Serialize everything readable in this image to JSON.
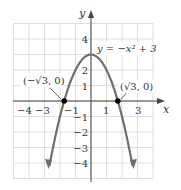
{
  "chart_data": {
    "type": "line",
    "title": "",
    "function_label": "y = −x² + 3",
    "xlabel": "x",
    "ylabel": "y",
    "xlim": [
      -5,
      4
    ],
    "ylim": [
      -5,
      5
    ],
    "grid": true,
    "x_tick_labels": [
      "−4",
      "−3",
      "−1",
      "1",
      "3"
    ],
    "y_tick_labels": [
      "4",
      "2",
      "1",
      "−1",
      "−2",
      "−3",
      "−4"
    ],
    "series": [
      {
        "name": "y = −x² + 3",
        "x": [
          -2.7,
          -2,
          -1.5,
          -1,
          -0.5,
          0,
          0.5,
          1,
          1.5,
          2,
          2.7
        ],
        "y": [
          -4.29,
          -1,
          0.75,
          2,
          2.75,
          3,
          2.75,
          2,
          0.75,
          -1,
          -4.29
        ]
      }
    ],
    "points": [
      {
        "label": "(−√3, 0)",
        "x": -1.732,
        "y": 0
      },
      {
        "label": "(√3, 0)",
        "x": 1.732,
        "y": 0
      }
    ],
    "colors": {
      "curve": "#6e6e6e",
      "grid": "#d6d6d6",
      "axis": "#444444"
    }
  }
}
